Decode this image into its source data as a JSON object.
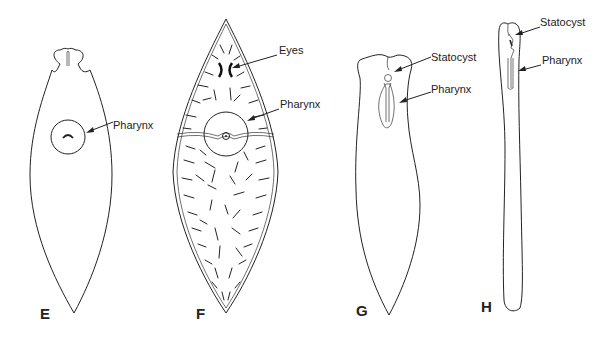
{
  "figure": {
    "panels": [
      {
        "id": "E",
        "label": "E",
        "annotations": [
          {
            "text": "Pharynx"
          }
        ]
      },
      {
        "id": "F",
        "label": "F",
        "annotations": [
          {
            "text": "Eyes"
          },
          {
            "text": "Pharynx"
          }
        ]
      },
      {
        "id": "G",
        "label": "G",
        "annotations": [
          {
            "text": "Statocyst"
          },
          {
            "text": "Pharynx"
          }
        ]
      },
      {
        "id": "H",
        "label": "H",
        "annotations": [
          {
            "text": "Statocyst"
          },
          {
            "text": "Pharynx"
          }
        ]
      }
    ]
  }
}
